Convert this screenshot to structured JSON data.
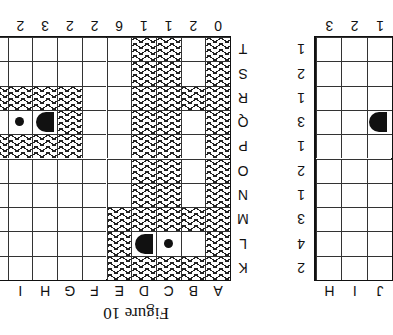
{
  "figure": {
    "caption": "Figure 10",
    "left_grid": {
      "column_labels_bottom": [
        "A",
        "B",
        "C",
        "D",
        "E",
        "F",
        "G",
        "H",
        "I"
      ],
      "column_clues_top": [
        "0",
        "2",
        "1",
        "1",
        "6",
        "2",
        "2",
        "3",
        "2"
      ],
      "row_labels": [
        "K",
        "L",
        "M",
        "N",
        "O",
        "P",
        "Q",
        "R",
        "S",
        "T"
      ],
      "hatched_cells_note": "hatched = shaded pattern",
      "rows": {
        "K": "HHHHH....",
        "L": "H.dD H....",
        "M": "HHHHH....",
        "N": "H.HH.....",
        "O": "H.HH.....",
        "P": "H.HH..HHH",
        "Q": "H.HH..HDd",
        "R": "HHHH..HHH",
        "S": "H.HH.....",
        "T": "H.HH....."
      }
    },
    "right_grid": {
      "column_labels_bottom": [
        "H",
        "I",
        "J"
      ],
      "column_clues_top": [
        "3",
        "2",
        "1"
      ],
      "row_clues": [
        "2",
        "4",
        "3",
        "1",
        "2",
        "1",
        "3",
        "1",
        "2",
        "1"
      ]
    }
  }
}
